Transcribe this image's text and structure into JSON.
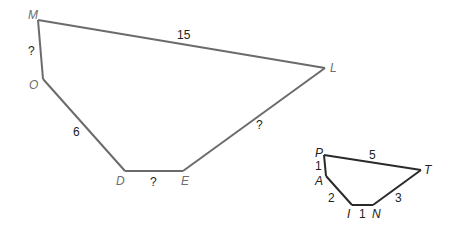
{
  "figure": {
    "large_polygon": {
      "vertices": [
        "M",
        "L",
        "E",
        "D",
        "O"
      ],
      "sides": [
        {
          "from": "M",
          "to": "L",
          "label": "15"
        },
        {
          "from": "L",
          "to": "E",
          "label": "?"
        },
        {
          "from": "E",
          "to": "D",
          "label": "?"
        },
        {
          "from": "D",
          "to": "O",
          "label": "6"
        },
        {
          "from": "O",
          "to": "M",
          "label": "?"
        }
      ]
    },
    "small_polygon": {
      "vertices": [
        "P",
        "T",
        "N",
        "I",
        "A"
      ],
      "sides": [
        {
          "from": "P",
          "to": "T",
          "label": "5"
        },
        {
          "from": "T",
          "to": "N",
          "label": "3"
        },
        {
          "from": "N",
          "to": "I",
          "label": "1"
        },
        {
          "from": "I",
          "to": "A",
          "label": "2"
        },
        {
          "from": "A",
          "to": "P",
          "label": "1"
        }
      ]
    }
  }
}
